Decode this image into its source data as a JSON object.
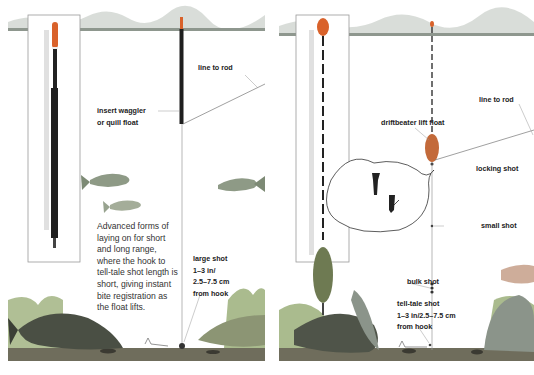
{
  "left_panel": {
    "title": "insert waggler float rig",
    "labels": {
      "line_to_rod": "line to rod",
      "float_line1": "insert waggler",
      "float_line2": "or quill float",
      "large_shot_line1": "large shot",
      "large_shot_line2": "1–3 in/",
      "large_shot_line3": "2.5–7.5 cm",
      "large_shot_line4": "from hook"
    },
    "description_lines": [
      "Advanced forms of",
      "laying on for short",
      "and long range,",
      "where the hook to",
      "tell-tale shot length is",
      "short, giving instant",
      "bite registration as",
      "the float lifts."
    ]
  },
  "right_panel": {
    "title": "driftbeater lift float rig",
    "labels": {
      "line_to_rod": "line to rod",
      "float": "driftbeater lift float",
      "locking_shot": "locking shot",
      "small_shot": "small shot",
      "bulk_shot": "bulk shot",
      "telltale_line1": "tell-tale shot",
      "telltale_line2": "1–3 in/2.5–7.5 cm",
      "telltale_line3": "from hook"
    }
  },
  "colors": {
    "water_surface": "#9aa39a",
    "float_tip": "#d9622b",
    "float_body": "#2b2b2b",
    "fish": "#8a9a7a",
    "weed": "#7f9a55",
    "riverbed": "#6b6a5a"
  }
}
